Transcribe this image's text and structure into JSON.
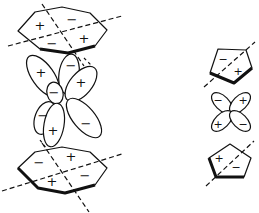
{
  "figure": {
    "stroke_color": "#111111",
    "background": "#ffffff"
  },
  "left_sandwich": {
    "top_ring": {
      "shape": "heptagon",
      "signs": [
        {
          "text": "+",
          "x": 40,
          "y": 25
        },
        {
          "text": "−",
          "x": 72,
          "y": 19
        },
        {
          "text": "−",
          "x": 52,
          "y": 43
        },
        {
          "text": "+",
          "x": 84,
          "y": 38
        }
      ]
    },
    "orbital": {
      "type": "d-orbital (mixed lobes)",
      "signs": [
        {
          "text": "+",
          "x": 41,
          "y": 72
        },
        {
          "text": "−",
          "x": 71,
          "y": 65
        },
        {
          "text": "+",
          "x": 81,
          "y": 82
        },
        {
          "text": "−",
          "x": 54,
          "y": 92
        },
        {
          "text": "−",
          "x": 43,
          "y": 115
        },
        {
          "text": "+",
          "x": 53,
          "y": 130
        },
        {
          "text": "−",
          "x": 86,
          "y": 123
        }
      ]
    },
    "bottom_ring": {
      "shape": "heptagon",
      "signs": [
        {
          "text": "−",
          "x": 39,
          "y": 162
        },
        {
          "text": "+",
          "x": 71,
          "y": 156
        },
        {
          "text": "+",
          "x": 52,
          "y": 181
        },
        {
          "text": "−",
          "x": 85,
          "y": 175
        }
      ]
    }
  },
  "right_sandwich": {
    "top_ring": {
      "shape": "pentagon",
      "signs": [
        {
          "text": "−",
          "x": 223,
          "y": 59
        },
        {
          "text": "+",
          "x": 238,
          "y": 71
        }
      ]
    },
    "orbital": {
      "type": "d-orbital (cloverleaf)",
      "signs": [
        {
          "text": "−",
          "x": 218,
          "y": 100
        },
        {
          "text": "+",
          "x": 243,
          "y": 100
        },
        {
          "text": "+",
          "x": 218,
          "y": 124
        },
        {
          "text": "−",
          "x": 243,
          "y": 124
        }
      ]
    },
    "bottom_ring": {
      "shape": "pentagon",
      "signs": [
        {
          "text": "+",
          "x": 219,
          "y": 158
        },
        {
          "text": "−",
          "x": 236,
          "y": 167
        }
      ]
    }
  }
}
